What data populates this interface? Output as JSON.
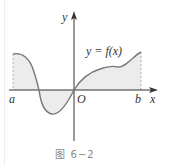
{
  "figure": {
    "caption": "图 6−2",
    "function_label": "y = f(x)",
    "axes": {
      "x_label": "x",
      "y_label": "y",
      "origin_label": "O"
    },
    "interval": {
      "left_label": "a",
      "right_label": "b"
    },
    "colors": {
      "curve": "#777777",
      "axis": "#333333",
      "fill": "#ececec",
      "dashed": "#aaaaaa",
      "caption": "#888888"
    }
  }
}
